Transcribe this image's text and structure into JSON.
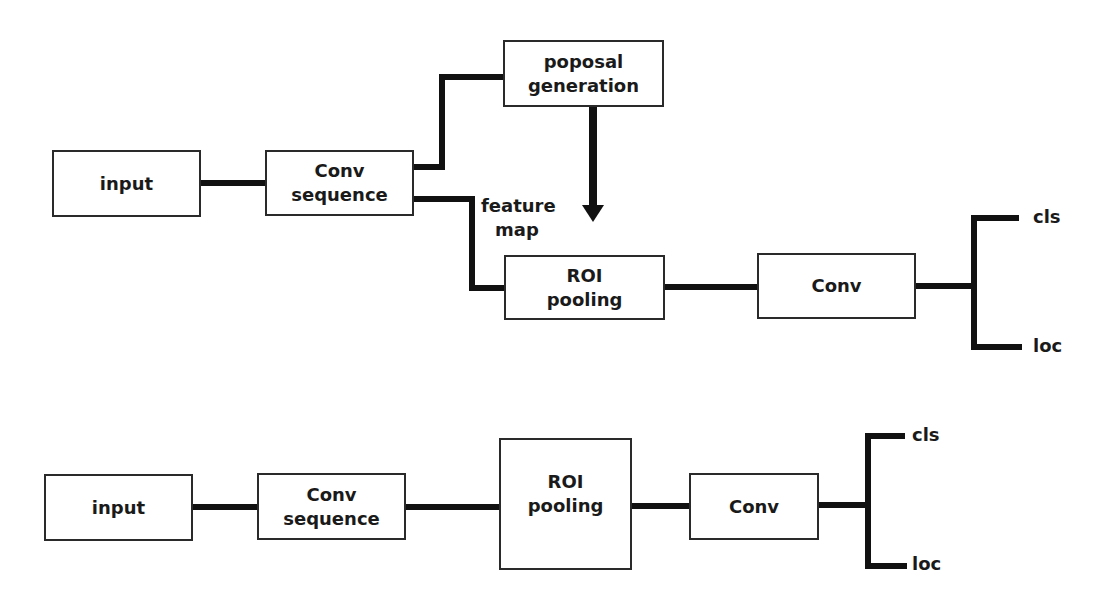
{
  "top_diagram": {
    "input": {
      "label": "input"
    },
    "conv_sequence": {
      "line1": "Conv",
      "line2": "sequence"
    },
    "proposal_generation": {
      "line1": "poposal",
      "line2": "generation"
    },
    "feature_map": {
      "line1": "feature",
      "line2": "map"
    },
    "roi_pooling": {
      "line1": "ROI",
      "line2": "pooling"
    },
    "conv": {
      "label": "Conv"
    },
    "outputs": {
      "cls": "cls",
      "loc": "loc"
    }
  },
  "bottom_diagram": {
    "input": {
      "label": "input"
    },
    "conv_sequence": {
      "line1": "Conv",
      "line2": "sequence"
    },
    "roi_pooling": {
      "line1": "ROI",
      "line2": "pooling"
    },
    "conv": {
      "label": "Conv"
    },
    "outputs": {
      "cls": "cls",
      "loc": "loc"
    }
  },
  "colors": {
    "stroke": "#111111",
    "box_border": "#2a2a2a",
    "background": "#ffffff"
  }
}
